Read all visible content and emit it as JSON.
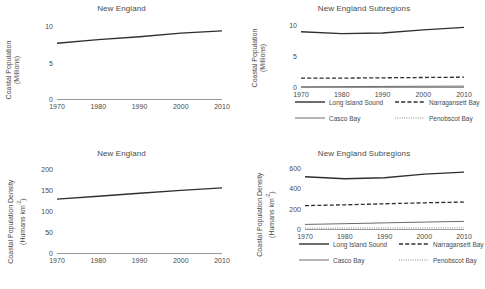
{
  "figure": {
    "width": 485,
    "height": 289,
    "background": "#ffffff",
    "line_color": "#2f2f2f",
    "axis_color": "#9a9a9a",
    "text_color": "#4a4a4a"
  },
  "panels": [
    {
      "id": "top-left",
      "title": "New England",
      "ylabel_line1": "Coastal Population",
      "ylabel_line2": "(Millions)"
    },
    {
      "id": "top-right",
      "title": "New England Subregions",
      "ylabel_line1": "Coastal Population",
      "ylabel_line2": "(Millions)"
    },
    {
      "id": "bottom-left",
      "title": "New England",
      "ylabel_line1": "Coastal Population Density",
      "ylabel_line2": "(Humans km",
      "ylabel_sup": "-2",
      "ylabel_line2_end": ")"
    },
    {
      "id": "bottom-right",
      "title": "New England Subregions",
      "ylabel_line1": "Coastal Population Density",
      "ylabel_line2": "(Humans km",
      "ylabel_sup": "-2",
      "ylabel_line2_end": ")"
    }
  ],
  "legend": {
    "entries": [
      {
        "label": "Long Island Sound",
        "style": "solid-thick"
      },
      {
        "label": "Narragansett Bay",
        "style": "dashed"
      },
      {
        "label": "Casco Bay",
        "style": "solid-thin"
      },
      {
        "label": "Penobscot Bay",
        "style": "dotted"
      }
    ]
  },
  "chart_data": [
    {
      "type": "line",
      "panel": "top-left",
      "title": "New England",
      "xlabel": "",
      "ylabel": "Coastal Population (Millions)",
      "x": [
        1970,
        1980,
        1990,
        2000,
        2010
      ],
      "xticks": [
        "1970",
        "1980",
        "1990",
        "2000",
        "2010"
      ],
      "yticks": [
        0,
        5,
        10
      ],
      "ytick_labels": [
        "0",
        "5",
        "10"
      ],
      "xlim": [
        1970,
        2010
      ],
      "ylim": [
        0,
        11
      ],
      "grid": false,
      "legend_position": "none",
      "series": [
        {
          "name": "New England",
          "style": "solid-thick",
          "values": [
            7.8,
            8.3,
            8.7,
            9.2,
            9.5
          ]
        }
      ]
    },
    {
      "type": "line",
      "panel": "top-right",
      "title": "New England Subregions",
      "xlabel": "",
      "ylabel": "Coastal Population (Millions)",
      "x": [
        1970,
        1980,
        1990,
        2000,
        2010
      ],
      "xticks": [
        "1970",
        "1980",
        "1990",
        "2000",
        "2010"
      ],
      "yticks": [
        0,
        5,
        10
      ],
      "ytick_labels": [
        "0",
        "5",
        "10"
      ],
      "xlim": [
        1970,
        2010
      ],
      "ylim": [
        0,
        11
      ],
      "grid": false,
      "legend_position": "below",
      "series": [
        {
          "name": "Long Island Sound",
          "style": "solid-thick",
          "values": [
            9.1,
            8.8,
            8.9,
            9.4,
            9.8
          ]
        },
        {
          "name": "Narragansett Bay",
          "style": "dashed",
          "values": [
            1.6,
            1.6,
            1.65,
            1.7,
            1.75
          ]
        },
        {
          "name": "Casco Bay",
          "style": "solid-thin",
          "values": [
            0.2,
            0.22,
            0.25,
            0.28,
            0.3
          ]
        },
        {
          "name": "Penobscot Bay",
          "style": "dotted",
          "values": [
            0.1,
            0.1,
            0.11,
            0.12,
            0.12
          ]
        }
      ]
    },
    {
      "type": "line",
      "panel": "bottom-left",
      "title": "New England",
      "xlabel": "",
      "ylabel": "Coastal Population Density (Humans km-2)",
      "x": [
        1970,
        1980,
        1990,
        2000,
        2010
      ],
      "xticks": [
        "1970",
        "1980",
        "1990",
        "2000",
        "2010"
      ],
      "yticks": [
        0,
        50,
        100,
        150,
        200
      ],
      "ytick_labels": [
        "0",
        "50",
        "100",
        "150",
        "200"
      ],
      "xlim": [
        1970,
        2010
      ],
      "ylim": [
        0,
        215
      ],
      "grid": false,
      "legend_position": "none",
      "series": [
        {
          "name": "New England",
          "style": "solid-thick",
          "values": [
            131,
            138,
            145,
            152,
            158
          ]
        }
      ]
    },
    {
      "type": "line",
      "panel": "bottom-right",
      "title": "New England Subregions",
      "xlabel": "",
      "ylabel": "Coastal Population Density (Humans km-2)",
      "x": [
        1970,
        1980,
        1990,
        2000,
        2010
      ],
      "xticks": [
        "1970",
        "1980",
        "1990",
        "2000",
        "2010"
      ],
      "yticks": [
        0,
        200,
        400,
        600
      ],
      "ytick_labels": [
        "0",
        "200",
        "400",
        "600"
      ],
      "xlim": [
        1970,
        2010
      ],
      "ylim": [
        0,
        650
      ],
      "grid": false,
      "legend_position": "below",
      "series": [
        {
          "name": "Long Island Sound",
          "style": "solid-thick",
          "values": [
            525,
            505,
            515,
            550,
            570
          ]
        },
        {
          "name": "Narragansett Bay",
          "style": "dashed",
          "values": [
            240,
            248,
            258,
            268,
            275
          ]
        },
        {
          "name": "Casco Bay",
          "style": "solid-thin",
          "values": [
            55,
            62,
            70,
            78,
            85
          ]
        },
        {
          "name": "Penobscot Bay",
          "style": "dotted",
          "values": [
            18,
            19,
            20,
            21,
            22
          ]
        }
      ]
    }
  ]
}
